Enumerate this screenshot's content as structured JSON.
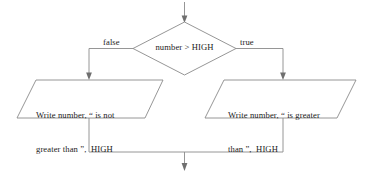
{
  "diagram": {
    "background_color": "#ffffff",
    "line_color": "#8a8a8a",
    "text_color": "#1c1c1c",
    "decision": {
      "shape": "diamond",
      "label": "number > HIGH"
    },
    "branches": {
      "false_label": "false",
      "true_label": "true"
    },
    "process_left": {
      "shape": "parallelogram",
      "line1": "Write number, “ is not",
      "line2": "greater than ”,  HIGH"
    },
    "process_right": {
      "shape": "parallelogram",
      "line1": "Write number, “ is greater",
      "line2": "than ”,  HIGH"
    },
    "connectors": {
      "entry_arrow": "arrow-down-icon",
      "false_branch_arrow": "arrow-down-icon",
      "true_branch_arrow": "arrow-down-icon",
      "exit_arrow": "arrow-down-icon"
    }
  }
}
